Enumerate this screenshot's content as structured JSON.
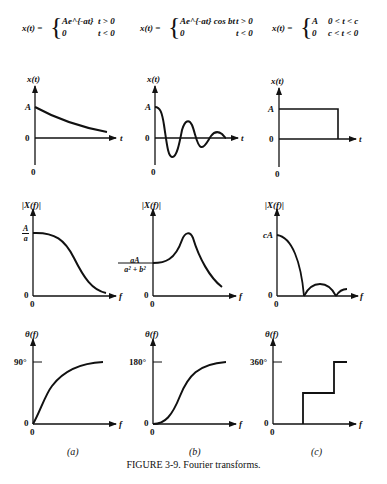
{
  "figure": {
    "caption": "FIGURE 3-9. Fourier transforms.",
    "panel_labels": [
      "(a)",
      "(b)",
      "(c)"
    ]
  },
  "equations": [
    {
      "lhs": "x(t) =",
      "case1_expr": "Ae^{-at}",
      "case1_cond": "t > 0",
      "case2_expr": "0",
      "case2_cond": "t < 0"
    },
    {
      "lhs": "x(t) =",
      "case1_expr": "Ae^{-at} cos bt",
      "case1_cond": "t > 0",
      "case2_expr": "0",
      "case2_cond": "t < 0"
    },
    {
      "lhs": "x(t) =",
      "case1_expr": "A",
      "case1_cond": "0 < t < c",
      "case2_expr": "0",
      "case2_cond": "c < t < 0"
    }
  ],
  "rows": [
    {
      "name": "time-domain",
      "ylabel": "x(t)",
      "xlabel": "t",
      "panels": [
        {
          "id": "a",
          "ytick": "A",
          "origin": "0",
          "shape": "decaying exponential"
        },
        {
          "id": "b",
          "ytick": "A",
          "origin": "0",
          "shape": "damped cosine"
        },
        {
          "id": "c",
          "ytick": "A",
          "origin": "0",
          "shape": "rectangular pulse"
        }
      ]
    },
    {
      "name": "magnitude-spectrum",
      "ylabel": "|X(f)|",
      "xlabel": "f",
      "panels": [
        {
          "id": "a",
          "ytick_num": "A",
          "ytick_den": "a",
          "origin": "0",
          "shape": "monotonic decay"
        },
        {
          "id": "b",
          "ytick_num": "aA",
          "ytick_den": "a² + b²",
          "origin": "0",
          "shape": "resonant peak"
        },
        {
          "id": "c",
          "ytick": "cA",
          "origin": "0",
          "shape": "|sinc|"
        }
      ]
    },
    {
      "name": "phase-spectrum",
      "ylabel": "θ(f)",
      "xlabel": "f",
      "panels": [
        {
          "id": "a",
          "ytick": "90°",
          "origin": "0",
          "shape": "rise to 90"
        },
        {
          "id": "b",
          "ytick": "180°",
          "origin": "0",
          "shape": "S-curve to 180"
        },
        {
          "id": "c",
          "ytick": "360°",
          "origin": "0",
          "shape": "staircase"
        }
      ]
    }
  ]
}
